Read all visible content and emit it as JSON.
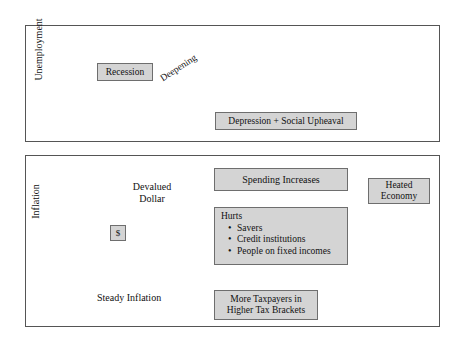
{
  "figure": {
    "panels": [
      {
        "id": "unemployment",
        "axis_label": "Unemployment",
        "nodes": [
          {
            "id": "recession",
            "label": "Recession"
          },
          {
            "id": "depression",
            "label": "Depression + Social Upheaval"
          }
        ],
        "edge_labels": [
          {
            "id": "deepening",
            "label": "Deepening"
          }
        ]
      },
      {
        "id": "inflation",
        "axis_label": "Inflation",
        "nodes": [
          {
            "id": "devalued-dollar",
            "label": "Devalued Dollar"
          },
          {
            "id": "dollar-symbol",
            "label": "$"
          },
          {
            "id": "spending-increases",
            "label": "Spending Increases"
          },
          {
            "id": "heated-economy",
            "label": "Heated Economy"
          },
          {
            "id": "more-taxpayers",
            "label": "More Taxpayers in Higher Tax Brackets"
          }
        ],
        "hurts_box": {
          "title": "Hurts",
          "bullet": "•",
          "items": [
            "Savers",
            "Credit institutions",
            "People on fixed incomes"
          ]
        },
        "edge_labels": [
          {
            "id": "steady-inflation",
            "label": "Steady Inflation"
          }
        ]
      }
    ],
    "text": {
      "unemployment_axis": "Unemployment",
      "inflation_axis": "Inflation",
      "recession": "Recession",
      "deepening": "Deepening",
      "depression": "Depression + Social Upheaval",
      "devalued_line1": "Devalued",
      "devalued_line2": "Dollar",
      "dollar_symbol": "$",
      "spending_increases": "Spending Increases",
      "hurts_title": "Hurts",
      "hurts_bullet": "•",
      "hurts_item_1": "Savers",
      "hurts_item_2": "Credit institutions",
      "hurts_item_3": "People on fixed incomes",
      "heated_line1": "Heated",
      "heated_line2": "Economy",
      "steady_inflation": "Steady Inflation",
      "taxpayers_line1": "More Taxpayers in",
      "taxpayers_line2": "Higher Tax Brackets"
    },
    "colors": {
      "page_background": "#ffffff",
      "panel_border": "#555555",
      "node_fill": "#d4d4d4",
      "node_border": "#6e6e6e",
      "stroke": "#1a1a1a",
      "text": "#111111"
    }
  }
}
